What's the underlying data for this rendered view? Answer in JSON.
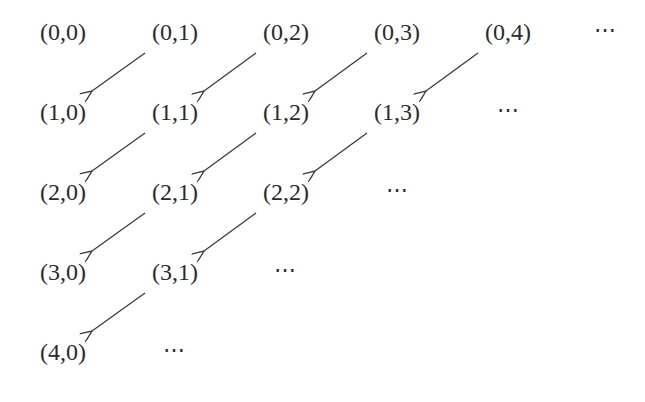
{
  "diagram": {
    "title": "",
    "rows": [
      {
        "cells": [
          "(0,0)",
          "(0,1)",
          "(0,2)",
          "(0,3)",
          "(0,4)"
        ],
        "ellipsis": "⋯"
      },
      {
        "cells": [
          "(1,0)",
          "(1,1)",
          "(1,2)",
          "(1,3)"
        ],
        "ellipsis": "⋯"
      },
      {
        "cells": [
          "(2,0)",
          "(2,1)",
          "(2,2)"
        ],
        "ellipsis": "⋯"
      },
      {
        "cells": [
          "(3,0)",
          "(3,1)"
        ],
        "ellipsis": "⋯"
      },
      {
        "cells": [
          "(4,0)"
        ],
        "ellipsis": "⋯"
      }
    ],
    "arrows": [
      {
        "from": "(0,1)",
        "to": "(1,0)"
      },
      {
        "from": "(0,2)",
        "to": "(1,1)"
      },
      {
        "from": "(0,3)",
        "to": "(1,2)"
      },
      {
        "from": "(0,4)",
        "to": "(1,3)"
      },
      {
        "from": "(1,1)",
        "to": "(2,0)"
      },
      {
        "from": "(1,2)",
        "to": "(2,1)"
      },
      {
        "from": "(1,3)",
        "to": "(2,2)"
      },
      {
        "from": "(2,1)",
        "to": "(3,0)"
      },
      {
        "from": "(2,2)",
        "to": "(3,1)"
      },
      {
        "from": "(3,1)",
        "to": "(4,0)"
      }
    ],
    "colors": {
      "text": "#2b2b2b",
      "arrow": "#3a3a3a",
      "background": "#ffffff"
    }
  }
}
